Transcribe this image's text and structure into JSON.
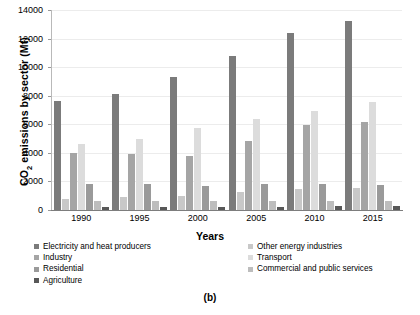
{
  "caption": "(b)",
  "chart_data": {
    "type": "bar",
    "title": "",
    "xlabel": "Years",
    "ylabel": "CO2 emissions by sector (Mt)",
    "ylabel_prefix": "CO",
    "ylabel_sub": "2",
    "ylabel_suffix": " emissions by sector (Mt)",
    "categories": [
      "1990",
      "1995",
      "2000",
      "2005",
      "2010",
      "2015"
    ],
    "yticks": [
      0,
      2000,
      4000,
      6000,
      8000,
      10000,
      12000,
      14000
    ],
    "ylim": [
      0,
      14000
    ],
    "grid": true,
    "legend_position": "bottom",
    "series": [
      {
        "name": "Electricity and heat producers",
        "color": "#7b7b7b",
        "values": [
          7600,
          8150,
          9300,
          10800,
          12400,
          13250
        ]
      },
      {
        "name": "Other energy industries",
        "color": "#c8c8c8",
        "values": [
          800,
          900,
          1000,
          1250,
          1500,
          1550
        ]
      },
      {
        "name": "Industry",
        "color": "#a5a5a5",
        "values": [
          4000,
          3900,
          3800,
          4800,
          5950,
          6150
        ]
      },
      {
        "name": "Transport",
        "color": "#dcdcdc",
        "values": [
          4600,
          5000,
          5750,
          6400,
          6900,
          7550
        ]
      },
      {
        "name": "Residential",
        "color": "#9a9a9a",
        "values": [
          1800,
          1800,
          1700,
          1800,
          1800,
          1750
        ]
      },
      {
        "name": "Commercial and public services",
        "color": "#bdbdbd",
        "values": [
          650,
          600,
          620,
          650,
          650,
          640
        ]
      },
      {
        "name": "Agriculture",
        "color": "#585858",
        "values": [
          200,
          200,
          220,
          240,
          260,
          260
        ]
      }
    ]
  },
  "legend": {
    "left": [
      "Electricity and heat producers",
      "Industry",
      "Residential",
      "Agriculture"
    ],
    "right": [
      "Other energy industries",
      "Transport",
      "Commercial and public services"
    ]
  }
}
